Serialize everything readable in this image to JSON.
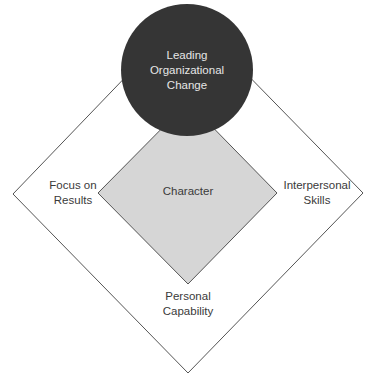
{
  "diagram": {
    "center_circle": {
      "label_lines": [
        "Leading",
        "Organizational",
        "Change"
      ],
      "fill": "#353535"
    },
    "inner_diamond": {
      "label": "Character",
      "fill": "#d6d6d6",
      "stroke": "#555555"
    },
    "outer_diamond": {
      "fill": "#ffffff",
      "stroke": "#555555"
    },
    "labels": {
      "left": [
        "Focus on",
        "Results"
      ],
      "right": [
        "Interpersonal",
        "Skills"
      ],
      "bottom": [
        "Personal",
        "Capability"
      ]
    }
  }
}
